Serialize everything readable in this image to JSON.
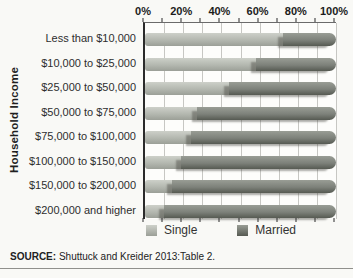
{
  "figure": {
    "ylabel": "Household Income",
    "source_label": "SOURCE:",
    "source_text": " Shuttuck and Kreider 2013:Table 2."
  },
  "chart_data": {
    "type": "bar",
    "orientation": "horizontal",
    "stacked": true,
    "unit": "percent",
    "xlim": [
      0,
      100
    ],
    "x_tick_labels": [
      "0%",
      "20%",
      "40%",
      "60%",
      "80%",
      "100%"
    ],
    "x_tick_label_step": 20,
    "gridline_step_percent": 10,
    "grid": "vertical",
    "ylabel": "Household Income",
    "legend_position": "bottom",
    "categories": [
      "Less than $10,000",
      "$10,000 to $25,000",
      "$25,000 to $50,000",
      "$50,000 to $75,000",
      "$75,000 to $100,000",
      "$100,000 to $150,000",
      "$150,000 to $200,000",
      "$200,000 and higher"
    ],
    "series": [
      {
        "name": "Single",
        "values": [
          72,
          58,
          44,
          27,
          24,
          19,
          14,
          10
        ],
        "color": "#b3b7af",
        "gradient": [
          "#cdd0c9",
          "#9b9f97"
        ]
      },
      {
        "name": "Married",
        "values": [
          28,
          42,
          56,
          73,
          76,
          81,
          86,
          90
        ],
        "color": "#7d817a",
        "gradient": [
          "#999d95",
          "#565a52"
        ]
      }
    ]
  }
}
